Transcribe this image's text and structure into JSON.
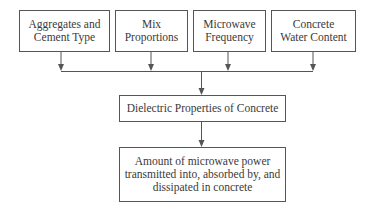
{
  "diagram": {
    "type": "flowchart",
    "inputs": [
      {
        "label": "Aggregates and\nCement Type"
      },
      {
        "label": "Mix\nProportions"
      },
      {
        "label": "Microwave\nFrequency"
      },
      {
        "label": "Concrete\nWater Content"
      }
    ],
    "middle": {
      "label": "Dielectric Properties of Concrete"
    },
    "output": {
      "label": "Amount of microwave power\ntransmitted into, absorbed by, and\ndissipated in concrete"
    },
    "colors": {
      "line": "#555555",
      "text": "#3a3a3a",
      "background": "#ffffff"
    }
  }
}
